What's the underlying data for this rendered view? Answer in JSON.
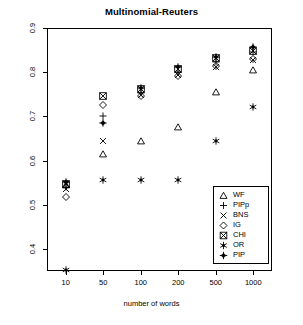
{
  "chart_data": {
    "type": "scatter",
    "title": "Multinomial-Reuters",
    "xlabel": "number of words",
    "ylabel": "micro F1",
    "x_categories": [
      "10",
      "50",
      "100",
      "200",
      "500",
      "1000"
    ],
    "x_scale": "categorical-log",
    "yticks": [
      "0.4",
      "0.5",
      "0.6",
      "0.7",
      "0.8",
      "0.9"
    ],
    "ylim": [
      0.35,
      0.9
    ],
    "grid": false,
    "legend_position": "bottom-right",
    "series": [
      {
        "name": "WF",
        "symbol": "triangle",
        "values": [
          0.545,
          0.615,
          0.645,
          0.675,
          0.755,
          0.805
        ]
      },
      {
        "name": "PIPp",
        "symbol": "plus",
        "values": [
          0.54,
          0.7,
          0.752,
          0.8,
          0.822,
          0.845
        ]
      },
      {
        "name": "BNS",
        "symbol": "cross",
        "values": [
          0.535,
          0.645,
          0.748,
          0.793,
          0.812,
          0.828
        ]
      },
      {
        "name": "IG",
        "symbol": "diamond",
        "values": [
          0.518,
          0.726,
          0.746,
          0.792,
          0.815,
          0.83
        ]
      },
      {
        "name": "CHI",
        "symbol": "square-x",
        "values": [
          0.548,
          0.745,
          0.762,
          0.808,
          0.833,
          0.848
        ]
      },
      {
        "name": "OR",
        "symbol": "asterisk",
        "values": [
          0.352,
          0.555,
          0.555,
          0.555,
          0.645,
          0.722
        ]
      },
      {
        "name": "PIP",
        "symbol": "plus-solid",
        "values": [
          0.552,
          0.686,
          0.765,
          0.812,
          0.835,
          0.856
        ]
      }
    ]
  }
}
